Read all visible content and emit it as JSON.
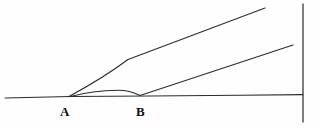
{
  "figure": {
    "background_color": "#fefefe",
    "stroke_color": "#2b2b2b",
    "width": 314,
    "height": 129,
    "labels": {
      "point_a": "A",
      "point_b": "B"
    },
    "geometry": {
      "baseline": {
        "name": "horizontal-baseline",
        "path": "M 5 98 L 70 96.5 L 150 96 L 240 95.2 L 303 94.6"
      },
      "upper_curve": {
        "name": "upper-rising-line",
        "path": "M 69 96.5 C 92 84 114 70 128 59.5 L 265 8"
      },
      "middle_curve": {
        "name": "middle-arc-to-b",
        "path": "M 69 96.7 C 85 92.5 104 90.3 118 90.2 C 128 90.2 134 92.4 140 95.6"
      },
      "lower_rising": {
        "name": "lower-rising-line",
        "path": "M 140 95.6 L 293 45"
      },
      "vertical_axis": {
        "name": "right-vertical-line",
        "path": "M 303 4 L 303 122"
      }
    }
  },
  "chart_data": {
    "type": "line",
    "title": "",
    "xlabel": "",
    "ylabel": "",
    "grid": false,
    "legend": null,
    "xlim": [
      0,
      314
    ],
    "ylim": [
      129,
      0
    ],
    "annotations": [
      {
        "text": "A",
        "x": 66,
        "y": 112,
        "role": "x-axis point label"
      },
      {
        "text": "B",
        "x": 142,
        "y": 112,
        "role": "x-axis point label"
      }
    ],
    "series": [
      {
        "name": "baseline",
        "points": [
          [
            5,
            98
          ],
          [
            70,
            96.5
          ],
          [
            150,
            96
          ],
          [
            240,
            95.2
          ],
          [
            303,
            94.6
          ]
        ]
      },
      {
        "name": "upper-rising-line",
        "points": [
          [
            69,
            96.5
          ],
          [
            100,
            78
          ],
          [
            128,
            59.5
          ],
          [
            265,
            8
          ]
        ]
      },
      {
        "name": "middle-arc-to-b",
        "points": [
          [
            69,
            96.7
          ],
          [
            95,
            91.5
          ],
          [
            118,
            90.2
          ],
          [
            140,
            95.6
          ]
        ]
      },
      {
        "name": "lower-rising-line",
        "points": [
          [
            140,
            95.6
          ],
          [
            293,
            45
          ]
        ]
      },
      {
        "name": "right-vertical-line",
        "points": [
          [
            303,
            4
          ],
          [
            303,
            122
          ]
        ]
      }
    ]
  }
}
